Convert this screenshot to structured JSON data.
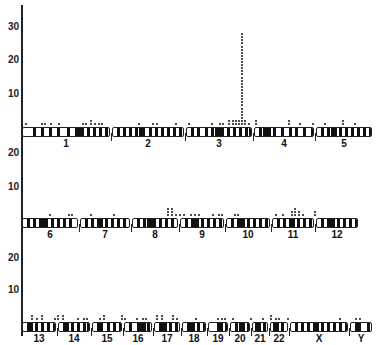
{
  "figure": {
    "panels": [
      {
        "id": "panel-1",
        "y_ticks": [
          {
            "label": "30",
            "y": 22
          },
          {
            "label": "20",
            "y": 55
          },
          {
            "label": "10",
            "y": 89
          }
        ],
        "row_top": 127,
        "chromosomes": [
          {
            "label": "1",
            "x": 0,
            "w": 90,
            "cen": 54,
            "bands": [
              10,
              18,
              26,
              34,
              44,
              52,
              58,
              64,
              70,
              76,
              82,
              86
            ]
          },
          {
            "label": "2",
            "x": 90,
            "w": 74,
            "cen": 28,
            "bands": [
              4,
              10,
              16,
              22,
              36,
              42,
              48,
              54,
              60,
              66
            ]
          },
          {
            "label": "3",
            "x": 164,
            "w": 68,
            "cen": 30,
            "bands": [
              4,
              10,
              18,
              24,
              34,
              40,
              46,
              52,
              58,
              62
            ]
          },
          {
            "label": "4",
            "x": 232,
            "w": 62,
            "cen": 12,
            "bands": [
              4,
              8,
              18,
              26,
              34,
              40,
              48,
              56
            ]
          },
          {
            "label": "5",
            "x": 294,
            "w": 58,
            "cen": 16,
            "bands": [
              4,
              10,
              22,
              28,
              34,
              40,
              46,
              52
            ]
          }
        ],
        "dots": [
          {
            "x": 3,
            "n": 1
          },
          {
            "x": 19,
            "n": 1
          },
          {
            "x": 22,
            "n": 1
          },
          {
            "x": 28,
            "n": 1
          },
          {
            "x": 36,
            "n": 1
          },
          {
            "x": 60,
            "n": 1
          },
          {
            "x": 63,
            "n": 1
          },
          {
            "x": 68,
            "n": 2
          },
          {
            "x": 72,
            "n": 1
          },
          {
            "x": 76,
            "n": 1
          },
          {
            "x": 79,
            "n": 1
          },
          {
            "x": 116,
            "n": 1
          },
          {
            "x": 130,
            "n": 1
          },
          {
            "x": 134,
            "n": 1
          },
          {
            "x": 153,
            "n": 1
          },
          {
            "x": 166,
            "n": 1
          },
          {
            "x": 189,
            "n": 1
          },
          {
            "x": 197,
            "n": 1
          },
          {
            "x": 200,
            "n": 1
          },
          {
            "x": 206,
            "n": 2
          },
          {
            "x": 210,
            "n": 2
          },
          {
            "x": 213,
            "n": 2
          },
          {
            "x": 216,
            "n": 2
          },
          {
            "x": 219,
            "n": 30
          },
          {
            "x": 222,
            "n": 2
          },
          {
            "x": 226,
            "n": 1
          },
          {
            "x": 233,
            "n": 2
          },
          {
            "x": 266,
            "n": 2
          },
          {
            "x": 277,
            "n": 1
          },
          {
            "x": 290,
            "n": 1
          },
          {
            "x": 302,
            "n": 1
          },
          {
            "x": 320,
            "n": 2
          },
          {
            "x": 332,
            "n": 1
          }
        ]
      },
      {
        "id": "panel-2",
        "y_ticks": [
          {
            "label": "20",
            "y": 148
          },
          {
            "label": "10",
            "y": 182
          }
        ],
        "row_top": 218,
        "chromosomes": [
          {
            "label": "6",
            "x": 0,
            "w": 58,
            "cen": 18,
            "bands": [
              4,
              10,
              22,
              28,
              34,
              40,
              46
            ]
          },
          {
            "label": "7",
            "x": 58,
            "w": 52,
            "cen": 18,
            "bands": [
              4,
              10,
              24,
              30,
              36,
              42
            ]
          },
          {
            "label": "8",
            "x": 110,
            "w": 48,
            "cen": 16,
            "bands": [
              4,
              10,
              20,
              26,
              32,
              38
            ]
          },
          {
            "label": "9",
            "x": 158,
            "w": 46,
            "cen": 14,
            "bands": [
              4,
              10,
              20,
              26,
              32,
              38
            ]
          },
          {
            "label": "10",
            "x": 204,
            "w": 46,
            "cen": 14,
            "bands": [
              4,
              10,
              20,
              26,
              32,
              38
            ]
          },
          {
            "label": "11",
            "x": 250,
            "w": 44,
            "cen": 18,
            "bands": [
              4,
              10,
              24,
              30,
              36
            ]
          },
          {
            "label": "12",
            "x": 294,
            "w": 44,
            "cen": 14,
            "bands": [
              4,
              10,
              20,
              26,
              32,
              38
            ]
          }
        ],
        "dots": [
          {
            "x": 27,
            "n": 1
          },
          {
            "x": 46,
            "n": 1
          },
          {
            "x": 49,
            "n": 1
          },
          {
            "x": 68,
            "n": 1
          },
          {
            "x": 91,
            "n": 1
          },
          {
            "x": 145,
            "n": 3
          },
          {
            "x": 149,
            "n": 3
          },
          {
            "x": 153,
            "n": 1
          },
          {
            "x": 157,
            "n": 1
          },
          {
            "x": 161,
            "n": 1
          },
          {
            "x": 168,
            "n": 1
          },
          {
            "x": 172,
            "n": 1
          },
          {
            "x": 176,
            "n": 1
          },
          {
            "x": 190,
            "n": 1
          },
          {
            "x": 196,
            "n": 1
          },
          {
            "x": 199,
            "n": 1
          },
          {
            "x": 212,
            "n": 1
          },
          {
            "x": 215,
            "n": 1
          },
          {
            "x": 253,
            "n": 1
          },
          {
            "x": 260,
            "n": 1
          },
          {
            "x": 269,
            "n": 2
          },
          {
            "x": 272,
            "n": 3
          },
          {
            "x": 276,
            "n": 2
          },
          {
            "x": 280,
            "n": 1
          },
          {
            "x": 292,
            "n": 2
          }
        ]
      },
      {
        "id": "panel-3",
        "y_ticks": [
          {
            "label": "20",
            "y": 253
          },
          {
            "label": "10",
            "y": 285
          }
        ],
        "row_top": 322,
        "chromosomes": [
          {
            "label": "13",
            "x": 0,
            "w": 36,
            "cen": 6,
            "bands": [
              12,
              18,
              24,
              30
            ]
          },
          {
            "label": "14",
            "x": 36,
            "w": 34,
            "cen": 6,
            "bands": [
              12,
              18,
              24,
              28
            ]
          },
          {
            "label": "15",
            "x": 70,
            "w": 32,
            "cen": 6,
            "bands": [
              14,
              20,
              26
            ]
          },
          {
            "label": "16",
            "x": 102,
            "w": 30,
            "cen": 14,
            "bands": [
              4,
              18,
              22,
              26
            ]
          },
          {
            "label": "17",
            "x": 132,
            "w": 28,
            "cen": 8,
            "bands": [
              4,
              14,
              20,
              24
            ]
          },
          {
            "label": "18",
            "x": 160,
            "w": 26,
            "cen": 8,
            "bands": [
              4,
              14,
              20
            ]
          },
          {
            "label": "19",
            "x": 186,
            "w": 22,
            "cen": 10,
            "bands": [
              16
            ]
          },
          {
            "label": "20",
            "x": 208,
            "w": 22,
            "cen": 10,
            "bands": [
              4,
              16
            ]
          },
          {
            "label": "21",
            "x": 230,
            "w": 18,
            "cen": 4,
            "bands": [
              10,
              14
            ]
          },
          {
            "label": "22",
            "x": 248,
            "w": 20,
            "cen": 4,
            "bands": [
              10,
              16
            ]
          },
          {
            "label": "X",
            "x": 268,
            "w": 60,
            "cen": 24,
            "bands": [
              4,
              10,
              16,
              30,
              36,
              42,
              48,
              54
            ]
          },
          {
            "label": "Y",
            "x": 328,
            "w": 24,
            "cen": 6,
            "bands": [
              16,
              20
            ]
          }
        ],
        "dots": [
          {
            "x": 9,
            "n": 2
          },
          {
            "x": 14,
            "n": 1
          },
          {
            "x": 19,
            "n": 2
          },
          {
            "x": 32,
            "n": 1
          },
          {
            "x": 35,
            "n": 2
          },
          {
            "x": 40,
            "n": 2
          },
          {
            "x": 55,
            "n": 1
          },
          {
            "x": 61,
            "n": 1
          },
          {
            "x": 64,
            "n": 1
          },
          {
            "x": 77,
            "n": 1
          },
          {
            "x": 81,
            "n": 2
          },
          {
            "x": 99,
            "n": 2
          },
          {
            "x": 102,
            "n": 1
          },
          {
            "x": 114,
            "n": 1
          },
          {
            "x": 120,
            "n": 1
          },
          {
            "x": 123,
            "n": 1
          },
          {
            "x": 134,
            "n": 2
          },
          {
            "x": 139,
            "n": 2
          },
          {
            "x": 150,
            "n": 2
          },
          {
            "x": 154,
            "n": 1
          },
          {
            "x": 173,
            "n": 1
          },
          {
            "x": 195,
            "n": 1
          },
          {
            "x": 199,
            "n": 1
          },
          {
            "x": 202,
            "n": 1
          },
          {
            "x": 210,
            "n": 1
          },
          {
            "x": 228,
            "n": 1
          },
          {
            "x": 240,
            "n": 1
          },
          {
            "x": 248,
            "n": 2
          },
          {
            "x": 253,
            "n": 1
          },
          {
            "x": 256,
            "n": 1
          },
          {
            "x": 265,
            "n": 1
          },
          {
            "x": 317,
            "n": 1
          },
          {
            "x": 333,
            "n": 1
          },
          {
            "x": 337,
            "n": 1
          }
        ]
      }
    ]
  }
}
